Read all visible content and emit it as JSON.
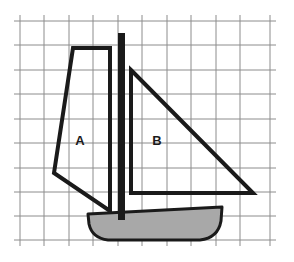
{
  "figure": {
    "background_color": "#ffffff",
    "width": 294,
    "height": 262
  },
  "grid": {
    "name": "square-grid",
    "line_color": "#8c8c8c",
    "line_width": 1,
    "cell_size": 24.4,
    "x_start": 20,
    "y_start": 21,
    "columns": 10,
    "rows": 9,
    "vertical_line_x": [
      20,
      44,
      69,
      93,
      118,
      142,
      167,
      191,
      216,
      240,
      270
    ],
    "horizontal_line_y": [
      21,
      45,
      70,
      94,
      119,
      143,
      168,
      192,
      216,
      240
    ]
  },
  "boat": {
    "outline_color": "#1a1a1a",
    "mast": {
      "name": "mast",
      "x": 118,
      "y_top": 33,
      "y_bottom": 220,
      "width": 7,
      "color": "#1a1a1a"
    },
    "sail_a": {
      "name": "sail-a",
      "label": "A",
      "label_x": 80,
      "label_y": 142,
      "stroke_color": "#1a1a1a",
      "stroke_width": 4,
      "fill": "none",
      "points": "73,48 110,48 110,211 54,173"
    },
    "sail_b": {
      "name": "sail-b",
      "label": "B",
      "label_x": 157,
      "label_y": 142,
      "stroke_color": "#1a1a1a",
      "stroke_width": 4,
      "fill": "none",
      "points": "131,70 253,193 131,193"
    },
    "hull": {
      "name": "hull",
      "fill_color": "#a8a8a8",
      "stroke_color": "#1a1a1a",
      "stroke_width": 3,
      "path": "M 88 214 L 222 207 L 221 221 Q 218 238 200 240 L 108 240 Q 92 238 89 224 Z"
    }
  },
  "labels": {
    "a": "A",
    "b": "B"
  }
}
